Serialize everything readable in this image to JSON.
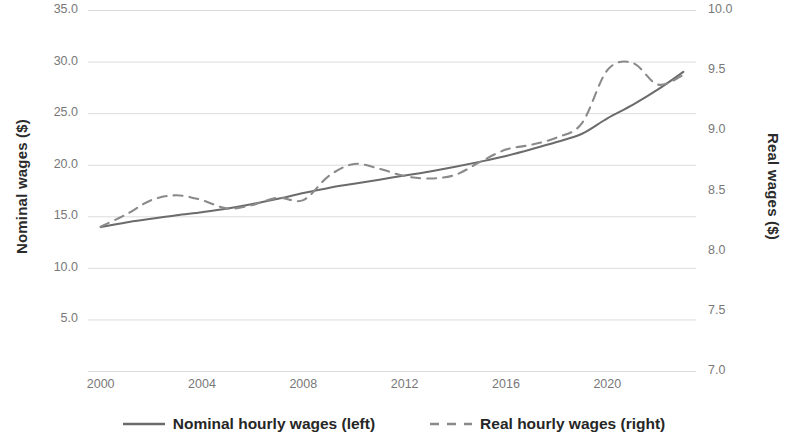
{
  "chart_data": {
    "type": "line",
    "title": "",
    "xlabel": "",
    "x_tick_labels": [
      "2000",
      "2004",
      "2008",
      "2012",
      "2016",
      "2020"
    ],
    "x_tick_values": [
      2000,
      2004,
      2008,
      2012,
      2016,
      2020
    ],
    "xlim": [
      1999.5,
      2023.5
    ],
    "grid": true,
    "grid_axis": "y",
    "legend_position": "bottom",
    "axes": [
      {
        "id": "left",
        "label": "Nominal wages ($)",
        "ylim": [
          0.0,
          35.0
        ],
        "ticks": [
          0.0,
          5.0,
          10.0,
          15.0,
          20.0,
          25.0,
          30.0,
          35.0
        ],
        "tick_labels": [
          "0.0",
          "5.0",
          "10.0",
          "15.0",
          "20.0",
          "25.0",
          "30.0",
          "35.0"
        ]
      },
      {
        "id": "right",
        "label": "Real wages ($)",
        "ylim": [
          7.0,
          10.0
        ],
        "ticks": [
          7.0,
          7.5,
          8.0,
          8.5,
          9.0,
          9.5,
          10.0
        ],
        "tick_labels": [
          "7.0",
          "7.5",
          "8.0",
          "8.5",
          "9.0",
          "9.5",
          "10.0"
        ]
      }
    ],
    "series": [
      {
        "name": "Nominal hourly wages (left)",
        "legend_label": "Nominal hourly wages (left)",
        "axis": "left",
        "style": "solid",
        "color": "#6b6b6b",
        "x": [
          2000,
          2001,
          2002,
          2003,
          2004,
          2005,
          2006,
          2007,
          2008,
          2009,
          2010,
          2011,
          2012,
          2013,
          2014,
          2015,
          2016,
          2017,
          2018,
          2019,
          2020,
          2021,
          2022,
          2023
        ],
        "values": [
          13.95,
          14.4,
          14.75,
          15.1,
          15.4,
          15.75,
          16.2,
          16.7,
          17.25,
          17.75,
          18.15,
          18.55,
          18.95,
          19.35,
          19.8,
          20.3,
          20.85,
          21.5,
          22.2,
          23.0,
          24.5,
          25.8,
          27.3,
          29.0
        ]
      },
      {
        "name": "Real hourly wages (right)",
        "legend_label": "Real hourly wages (right)",
        "axis": "right",
        "style": "dashed",
        "color": "#8a8a8a",
        "x": [
          2000,
          2001,
          2002,
          2003,
          2004,
          2005,
          2006,
          2007,
          2008,
          2009,
          2010,
          2011,
          2012,
          2013,
          2014,
          2015,
          2016,
          2017,
          2018,
          2019,
          2020,
          2021,
          2022,
          2023
        ],
        "values": [
          8.2,
          8.3,
          8.42,
          8.46,
          8.42,
          8.35,
          8.38,
          8.44,
          8.42,
          8.62,
          8.72,
          8.68,
          8.62,
          8.6,
          8.63,
          8.74,
          8.84,
          8.88,
          8.94,
          9.06,
          9.5,
          9.56,
          9.38,
          9.46
        ]
      }
    ]
  },
  "legend": {
    "items": [
      {
        "label": "Nominal hourly wages (left)",
        "style": "solid"
      },
      {
        "label": "Real hourly wages (right)",
        "style": "dashed"
      }
    ]
  },
  "colors": {
    "nominal_line": "#6b6b6b",
    "real_line": "#8a8a8a",
    "gridline": "#dcdcdc",
    "tick_text": "#787878",
    "axis_title_text": "#2b2b2b"
  }
}
